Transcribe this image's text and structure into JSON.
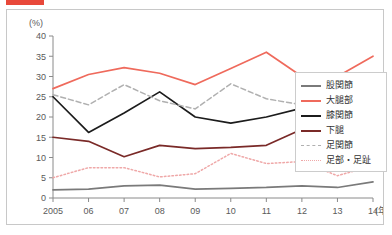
{
  "top_bar": {
    "marker_color": "#e8483a",
    "caption": ""
  },
  "chart_data": {
    "type": "line",
    "title": "",
    "subtitle": "",
    "xlabel": "(年)",
    "ylabel": "(%)",
    "y_unit": "(%)",
    "x_unit": "(年)",
    "grid": false,
    "legend_position": "right-inside",
    "xlim": [
      2005,
      2014
    ],
    "ylim": [
      0,
      40
    ],
    "ytick_step": 5,
    "yticks": [
      0,
      5,
      10,
      15,
      20,
      25,
      30,
      35,
      40
    ],
    "x": [
      2005,
      2006,
      2007,
      2008,
      2009,
      2010,
      2011,
      2012,
      2013,
      2014
    ],
    "categories": [
      "2005",
      "06",
      "07",
      "08",
      "09",
      "10",
      "11",
      "12",
      "13",
      "14"
    ],
    "series": [
      {
        "name": "股関節",
        "color": "#7a7a7a",
        "style": "solid",
        "values": [
          2.0,
          2.2,
          3.0,
          3.2,
          2.2,
          2.4,
          2.6,
          3.0,
          2.6,
          4.0
        ]
      },
      {
        "name": "大腿部",
        "color": "#ef6a5c",
        "style": "solid",
        "values": [
          27.0,
          30.5,
          32.2,
          30.8,
          28.0,
          32.0,
          36.0,
          30.0,
          30.0,
          35.0
        ]
      },
      {
        "name": "膝関節",
        "color": "#1c1c1c",
        "style": "solid",
        "values": [
          25.0,
          16.2,
          21.0,
          26.2,
          20.0,
          18.5,
          20.0,
          22.2,
          15.0,
          19.0
        ]
      },
      {
        "name": "下腿",
        "color": "#7a2a28",
        "style": "solid",
        "values": [
          15.0,
          14.0,
          10.2,
          13.0,
          12.2,
          12.5,
          13.0,
          17.0,
          11.0,
          19.2
        ]
      },
      {
        "name": "足関節",
        "color": "#b0b0b0",
        "style": "dashed",
        "values": [
          25.5,
          23.0,
          28.0,
          24.0,
          22.0,
          28.2,
          24.5,
          23.0,
          22.0,
          18.5
        ]
      },
      {
        "name": "足部・足趾",
        "color": "#efa8a8",
        "style": "dotted",
        "values": [
          5.0,
          7.5,
          7.5,
          5.2,
          6.0,
          11.0,
          8.5,
          9.0,
          5.5,
          8.0
        ]
      }
    ]
  }
}
